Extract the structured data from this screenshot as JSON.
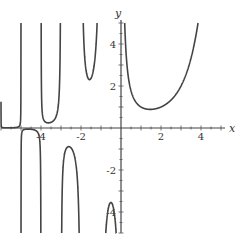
{
  "chart_data": {
    "type": "line",
    "title": "",
    "function": "Gamma(x)",
    "xlabel": "x",
    "ylabel": "y",
    "xlim": [
      -6,
      5.2
    ],
    "ylim": [
      -5,
      5
    ],
    "x_ticks": [
      -4,
      -2,
      2,
      4
    ],
    "y_ticks": [
      -4,
      -2,
      2,
      4
    ],
    "x_tick_labels": [
      "-4",
      "-2",
      "2",
      "4"
    ],
    "y_tick_labels": [
      "-4",
      "-2",
      "2",
      "4"
    ],
    "minor_tick_step": 0.5,
    "grid": false,
    "legend": null,
    "asymptotes_x": [
      0,
      -1,
      -2,
      -3,
      -4,
      -5
    ],
    "series": [
      {
        "name": "Gamma(x)",
        "color": "#444444",
        "sample_points": [
          {
            "x": 0.2,
            "y": 4.59
          },
          {
            "x": 0.5,
            "y": 1.77
          },
          {
            "x": 1.0,
            "y": 1.0
          },
          {
            "x": 1.46,
            "y": 0.886
          },
          {
            "x": 2.0,
            "y": 1.0
          },
          {
            "x": 3.0,
            "y": 2.0
          },
          {
            "x": 3.5,
            "y": 3.32
          },
          {
            "x": 4.0,
            "y": 6.0
          },
          {
            "x": -0.5,
            "y": -3.545
          },
          {
            "x": -1.5,
            "y": 2.363
          },
          {
            "x": -2.5,
            "y": -0.945
          },
          {
            "x": -3.5,
            "y": 0.27
          },
          {
            "x": -4.5,
            "y": -0.06
          }
        ]
      }
    ]
  },
  "axes": {
    "x_name": "x",
    "y_name": "y"
  }
}
